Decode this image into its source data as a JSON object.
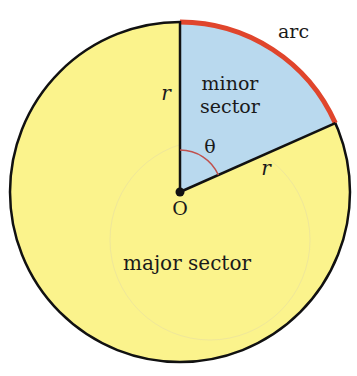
{
  "diagram": {
    "center": {
      "x": 180,
      "y": 192
    },
    "radius": 170,
    "theta_degrees": 66,
    "colors": {
      "major_fill": "#fbf38c",
      "minor_fill": "#b9d9ee",
      "arc_stroke": "#e0452c",
      "angle_mark": "#c0504d",
      "outline": "#111111"
    },
    "labels": {
      "arc": "arc",
      "minor_sector_line1": "minor",
      "minor_sector_line2": "sector",
      "major_sector": "major sector",
      "center": "O",
      "angle": "θ",
      "radius_vertical": "r",
      "radius_slanted": "r"
    }
  }
}
